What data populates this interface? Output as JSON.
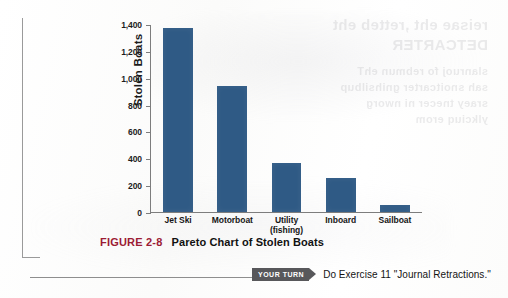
{
  "figure": {
    "number_label": "FIGURE 2-8",
    "title": "Pareto Chart of Stolen Boats",
    "number_color": "#9c1c35"
  },
  "your_turn": {
    "badge_label": "YOUR TURN",
    "instruction": "Do Exercise 11 \"Journal Retractions.\""
  },
  "bleed_through": {
    "line1": "reisae eht ,retteb eht",
    "line2": "DETCARTER",
    "line3": "slanruoj fo rebmun ehT",
    "line4": "sah snoitcarter gnihsilbup",
    "line5": "sraey tnecer ni nworg",
    "line6": "ylkciuq erom"
  },
  "chart_data": {
    "type": "bar",
    "title": "Pareto Chart of Stolen Boats",
    "xlabel": "",
    "ylabel": "Stolen Boats",
    "categories": [
      "Jet Ski",
      "Motorboat",
      "Utility (fishing)",
      "Inboard",
      "Sailboat"
    ],
    "values": [
      1370,
      940,
      365,
      255,
      50
    ],
    "ylim": [
      0,
      1400
    ],
    "yticks": [
      0,
      200,
      400,
      600,
      800,
      1000,
      1200,
      1400
    ],
    "ytick_labels": [
      "0",
      "200",
      "400",
      "600",
      "800",
      "1,000",
      "1,200",
      "1,400"
    ],
    "grid": false,
    "legend": false,
    "bar_color": "#2f5a85",
    "axis_color": "#7d7d7d"
  }
}
